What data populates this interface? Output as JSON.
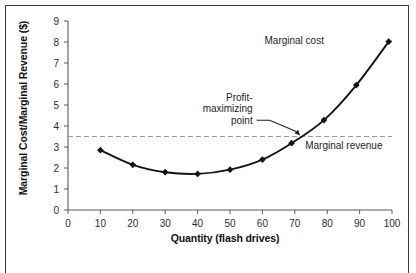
{
  "chart_data": {
    "type": "line",
    "title": "",
    "xlabel": "Quantity (flash drives)",
    "ylabel": "Marginal Cost/Marginal Revenue ($)",
    "xlim": [
      0,
      100
    ],
    "ylim": [
      0,
      9
    ],
    "xticks": [
      0,
      10,
      20,
      30,
      40,
      50,
      60,
      70,
      80,
      90,
      100
    ],
    "yticks": [
      0,
      1,
      2,
      3,
      4,
      5,
      6,
      7,
      8,
      9
    ],
    "grid": false,
    "legend": "none",
    "series": [
      {
        "name": "Marginal cost",
        "marker": "diamond",
        "x": [
          10,
          20,
          30,
          40,
          50,
          60,
          69,
          79,
          89,
          99
        ],
        "values": [
          2.85,
          2.15,
          1.8,
          1.72,
          1.92,
          2.4,
          3.18,
          4.28,
          5.95,
          8.02
        ]
      },
      {
        "name": "Marginal revenue",
        "type": "hline",
        "style": "dashed",
        "value": 3.5
      }
    ],
    "annotations": [
      {
        "name": "marginal-cost-label",
        "text": "Marginal cost",
        "x": 79,
        "y": 8.05
      },
      {
        "name": "marginal-revenue-label",
        "text": "Marginal revenue",
        "x": 80,
        "y": 3.08
      },
      {
        "name": "profit-maximizing-point-label",
        "lines": [
          "Profit-",
          "maximizing",
          "point"
        ],
        "x": 57,
        "y": 5.2,
        "points_to": {
          "x": 72,
          "y": 3.5
        }
      }
    ]
  },
  "axes": {
    "ytick_labels": [
      "0",
      "1",
      "2",
      "3",
      "4",
      "5",
      "6",
      "7",
      "8",
      "9"
    ],
    "xtick_labels": [
      "0",
      "10",
      "20",
      "30",
      "40",
      "50",
      "60",
      "70",
      "80",
      "90",
      "100"
    ],
    "y_axis_title": "Marginal Cost/Marginal Revenue ($)",
    "x_axis_title": "Quantity (flash drives)"
  },
  "labels": {
    "marginal_cost": "Marginal cost",
    "marginal_revenue": "Marginal revenue",
    "profit_line1": "Profit-",
    "profit_line2": "maximizing",
    "profit_line3": "point"
  },
  "colors": {
    "curve": "#141414",
    "dashed_line": "#9a9a9a",
    "axis": "#5a5a5a",
    "text": "#1a1a1a",
    "frame": "#3a3a3a",
    "background": "#ffffff"
  }
}
